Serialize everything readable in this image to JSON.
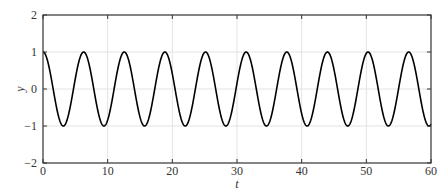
{
  "chart_data": {
    "type": "line",
    "title": "",
    "xlabel": "t",
    "ylabel": "y",
    "xlim": [
      0,
      60
    ],
    "ylim": [
      -2,
      2
    ],
    "xticks": [
      0,
      10,
      20,
      30,
      40,
      50,
      60
    ],
    "xtick_labels": [
      "0",
      "10",
      "20",
      "30",
      "40",
      "50",
      "60"
    ],
    "yticks": [
      -2,
      -1,
      0,
      1,
      2
    ],
    "ytick_labels": [
      "−2",
      "−1",
      "0",
      "1",
      "2"
    ],
    "grid": true,
    "legend": null,
    "series": [
      {
        "name": "y = cos(t)",
        "function": "cos",
        "color": "#000000",
        "x": [
          0,
          1.57,
          3.14,
          4.71,
          6.28,
          7.85,
          9.42,
          10.99,
          12.57,
          14.14,
          15.71,
          17.28,
          18.85,
          20.42,
          21.99,
          23.56,
          25.13,
          26.7,
          28.27,
          29.85,
          31.42,
          32.99,
          34.56,
          36.13,
          37.7,
          39.27,
          40.84,
          42.41,
          43.98,
          45.55,
          47.12,
          48.69,
          50.27,
          51.84,
          53.41,
          54.98,
          56.55,
          58.12,
          59.69,
          60
        ],
        "y": [
          1,
          0,
          -1,
          0,
          1,
          0,
          -1,
          0,
          1,
          0,
          -1,
          0,
          1,
          0,
          -1,
          0,
          1,
          0,
          -1,
          0,
          1,
          0,
          -1,
          0,
          1,
          0,
          -1,
          0,
          1,
          0,
          -1,
          0,
          1,
          0,
          -1,
          0,
          1,
          0,
          -1,
          -0.95
        ]
      }
    ]
  },
  "colors": {
    "axis": "#333333",
    "grid": "#e3e3e3",
    "line": "#000000"
  }
}
